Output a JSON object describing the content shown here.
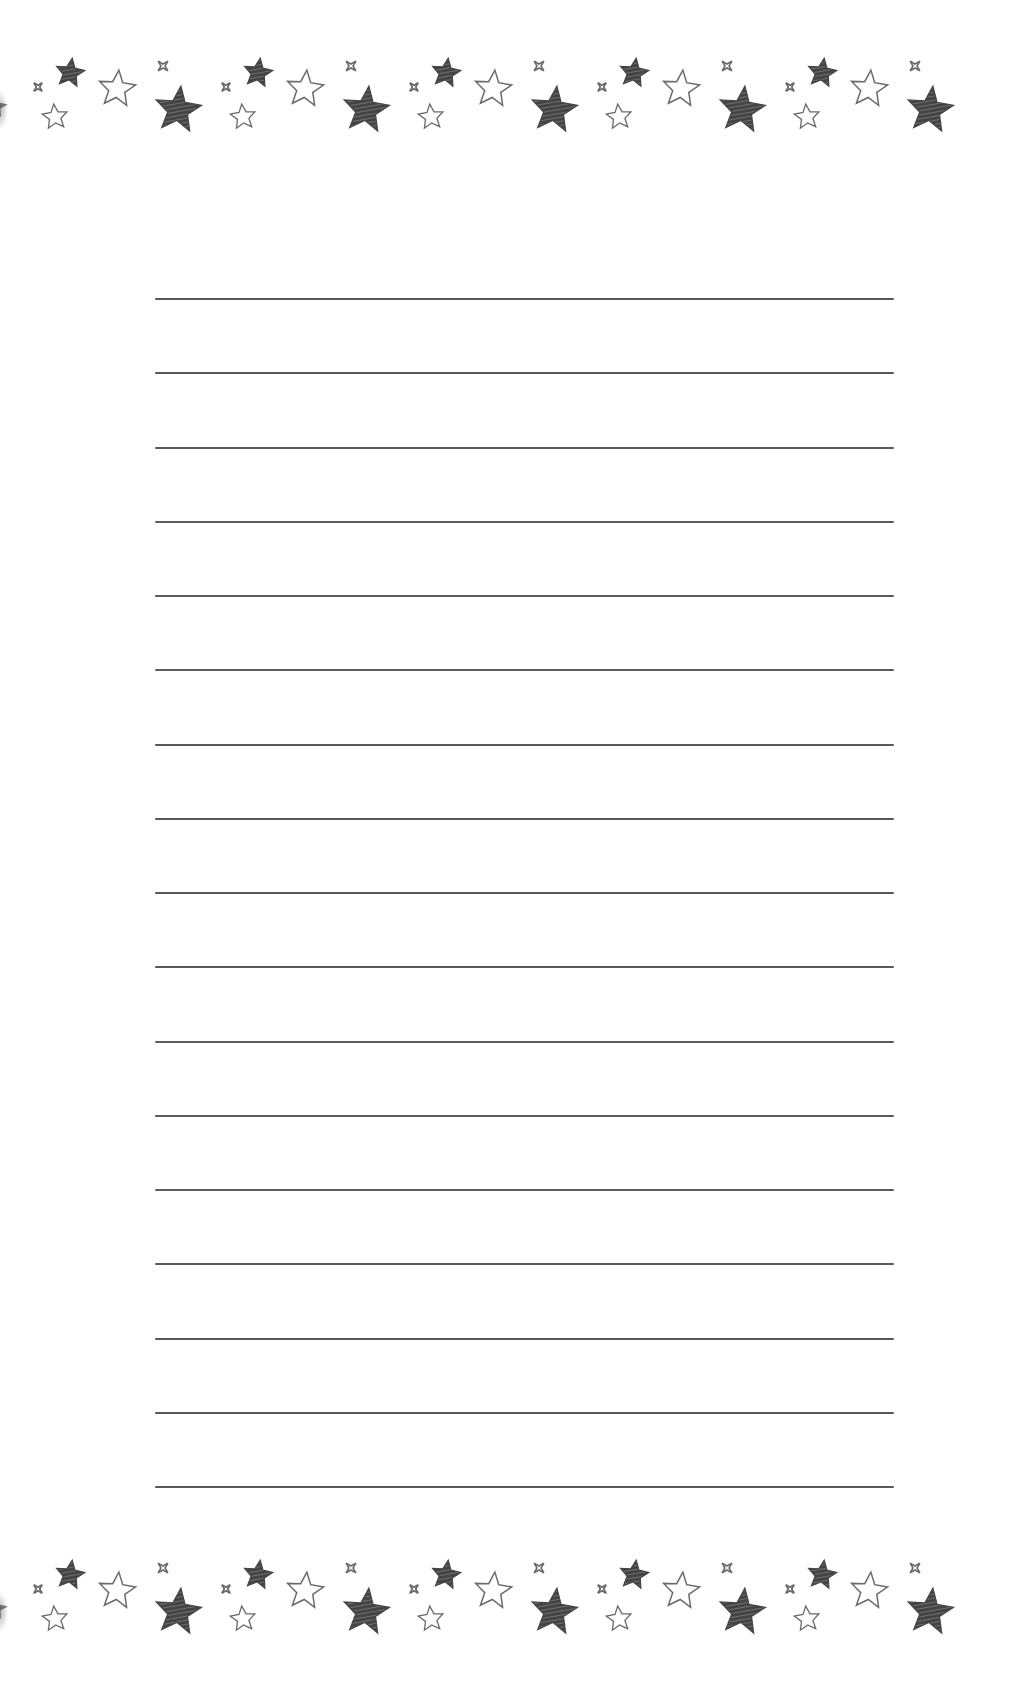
{
  "page": {
    "type": "lined-stationery",
    "background": "#ffffff",
    "line_color": "#5a5a5a",
    "line_count": 17,
    "first_line_y": 298,
    "line_spacing": 74.25,
    "line_left": 155,
    "line_right": 894
  },
  "borders": {
    "top": {
      "name": "top-star-border",
      "y": 45
    },
    "bottom": {
      "name": "bottom-star-border",
      "y": 1547
    },
    "tile_period": 188,
    "tile_origins_x": [
      30,
      218,
      406,
      594,
      782
    ],
    "icons": [
      "sparkle-icon",
      "filled-star-icon",
      "outline-star-icon",
      "large-filled-star-icon"
    ],
    "star_fill_color": "#444444",
    "star_outline_color": "#6a6a6a"
  }
}
